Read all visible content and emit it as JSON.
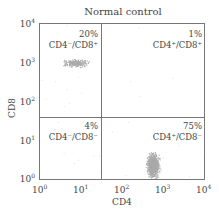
{
  "chart_data": {
    "type": "scatter",
    "title": "Normal control",
    "xlabel": "CD4",
    "ylabel": "CD8",
    "xscale": "log",
    "yscale": "log",
    "xlim": [
      1,
      10000
    ],
    "ylim": [
      1,
      10000
    ],
    "x_ticks": [
      "10^0",
      "10^1",
      "10^2",
      "10^3",
      "10^4"
    ],
    "y_ticks": [
      "10^0",
      "10^1",
      "10^2",
      "10^3",
      "10^4"
    ],
    "quadrant_gate": {
      "x": 30,
      "y": 50
    },
    "quadrants": [
      {
        "position": "upper-left",
        "percent": "20%",
        "label": "CD4-/CD8+"
      },
      {
        "position": "upper-right",
        "percent": "1%",
        "label": "CD4+/CD8+"
      },
      {
        "position": "lower-left",
        "percent": "4%",
        "label": "CD4-/CD8-"
      },
      {
        "position": "lower-right",
        "percent": "75%",
        "label": "CD4+/CD8-"
      }
    ],
    "clusters": [
      {
        "name": "CD4-/CD8+",
        "center": [
          7,
          1500
        ]
      },
      {
        "name": "CD4+/CD8-",
        "center": [
          600,
          3
        ]
      }
    ],
    "grid": false,
    "legend": null
  },
  "title": "Normal control",
  "xlabel": "CD4",
  "ylabel": "CD8",
  "xticks": [
    "10",
    "10",
    "10",
    "10",
    "10"
  ],
  "xexp": [
    "0",
    "1",
    "2",
    "3",
    "4"
  ],
  "q": {
    "ul_pct": "20%",
    "ul_label": "CD4⁻/CD8⁺",
    "ur_pct": "1%",
    "ur_label": "CD4⁺/CD8⁺",
    "ll_pct": "4%",
    "ll_label": "CD4⁻/CD8⁻",
    "lr_pct": "75%",
    "lr_label": "CD4⁺/CD8⁻"
  }
}
